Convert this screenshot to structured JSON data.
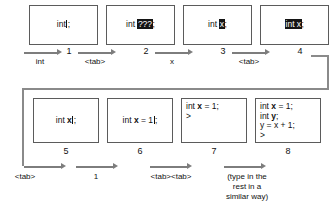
{
  "figure": {
    "steps": [
      {
        "number": "1",
        "lines": [
          {
            "segments": [
              {
                "text": "int",
                "style": "plain"
              },
              {
                "text": "",
                "style": "caret"
              },
              {
                "text": ";",
                "style": "plain"
              }
            ]
          }
        ]
      },
      {
        "number": "2",
        "lines": [
          {
            "segments": [
              {
                "text": "int ",
                "style": "plain"
              },
              {
                "text": "???",
                "style": "selected"
              },
              {
                "text": ";",
                "style": "plain"
              }
            ]
          }
        ]
      },
      {
        "number": "3",
        "lines": [
          {
            "segments": [
              {
                "text": "int ",
                "style": "plain"
              },
              {
                "text": "x",
                "style": "selected"
              },
              {
                "text": ";",
                "style": "plain"
              }
            ]
          }
        ]
      },
      {
        "number": "4",
        "lines": [
          {
            "segments": [
              {
                "text": "int x",
                "style": "selected"
              },
              {
                "text": ";",
                "style": "plain"
              }
            ]
          }
        ]
      },
      {
        "number": "5",
        "lines": [
          {
            "segments": [
              {
                "text": "int ",
                "style": "plain"
              },
              {
                "text": "x",
                "style": "bold"
              },
              {
                "text": "",
                "style": "caret"
              },
              {
                "text": ";",
                "style": "plain"
              }
            ]
          }
        ]
      },
      {
        "number": "6",
        "lines": [
          {
            "segments": [
              {
                "text": "int ",
                "style": "plain"
              },
              {
                "text": "x",
                "style": "bold"
              },
              {
                "text": " = 1",
                "style": "plain"
              },
              {
                "text": "",
                "style": "caret"
              },
              {
                "text": ";",
                "style": "plain"
              }
            ]
          }
        ]
      },
      {
        "number": "7",
        "lines": [
          {
            "segments": [
              {
                "text": "int ",
                "style": "plain"
              },
              {
                "text": "x",
                "style": "bold"
              },
              {
                "text": " = 1;",
                "style": "plain"
              }
            ]
          },
          {
            "segments": [
              {
                "text": ">",
                "style": "plain"
              }
            ]
          }
        ]
      },
      {
        "number": "8",
        "lines": [
          {
            "segments": [
              {
                "text": "int ",
                "style": "plain"
              },
              {
                "text": "x",
                "style": "bold"
              },
              {
                "text": " = 1;",
                "style": "plain"
              }
            ]
          },
          {
            "segments": [
              {
                "text": "int ",
                "style": "plain"
              },
              {
                "text": "y",
                "style": "bold"
              },
              {
                "text": ";",
                "style": "plain"
              }
            ]
          },
          {
            "segments": [
              {
                "text": "y = x + 1;",
                "style": "plain"
              }
            ]
          },
          {
            "segments": [
              {
                "text": ">",
                "style": "plain"
              }
            ]
          }
        ]
      }
    ],
    "transitions": [
      {
        "label": "int",
        "multiline": false
      },
      {
        "label": "<tab>",
        "multiline": false
      },
      {
        "label": "x",
        "multiline": false
      },
      {
        "label": "<tab>",
        "multiline": false
      },
      {
        "label": "<tab>",
        "multiline": false
      },
      {
        "label": "1",
        "multiline": false
      },
      {
        "label": "<tab><tab>",
        "multiline": false
      },
      {
        "label": "(type in the\nrest in a\nsimilar way)",
        "multiline": true
      }
    ],
    "colors": {
      "arrow": "#7d7d7d",
      "connector": "#8a8a8a",
      "box_border": "#5b5b5b",
      "selection_bg": "#141414",
      "text": "#111111",
      "background": "#ffffff"
    }
  }
}
